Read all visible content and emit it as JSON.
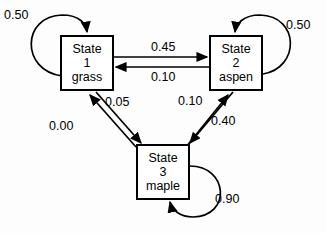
{
  "diagram": {
    "type": "markov-state-transition-diagram",
    "background_color": "#fdfdfd",
    "stroke_color": "#000000",
    "states": [
      {
        "id": "state1",
        "title": "State",
        "number": "1",
        "name": "grass",
        "self_loop_probability": "0.50"
      },
      {
        "id": "state2",
        "title": "State",
        "number": "2",
        "name": "aspen",
        "self_loop_probability": "0.50"
      },
      {
        "id": "state3",
        "title": "State",
        "number": "3",
        "name": "maple",
        "self_loop_probability": "0.90"
      }
    ],
    "transitions": [
      {
        "id": "t1-1",
        "from": "1",
        "to": "1",
        "label": "0.50"
      },
      {
        "id": "t1-2",
        "from": "1",
        "to": "2",
        "label": "0.45"
      },
      {
        "id": "t2-1",
        "from": "2",
        "to": "1",
        "label": "0.10"
      },
      {
        "id": "t1-3",
        "from": "1",
        "to": "3",
        "label": "0.05"
      },
      {
        "id": "t3-1",
        "from": "3",
        "to": "1",
        "label": "0.00"
      },
      {
        "id": "t2-2",
        "from": "2",
        "to": "2",
        "label": "0.50"
      },
      {
        "id": "t2-3",
        "from": "2",
        "to": "3",
        "label": "0.40"
      },
      {
        "id": "t3-2",
        "from": "3",
        "to": "2",
        "label": "0.10"
      },
      {
        "id": "t3-3",
        "from": "3",
        "to": "3",
        "label": "0.90"
      }
    ]
  }
}
